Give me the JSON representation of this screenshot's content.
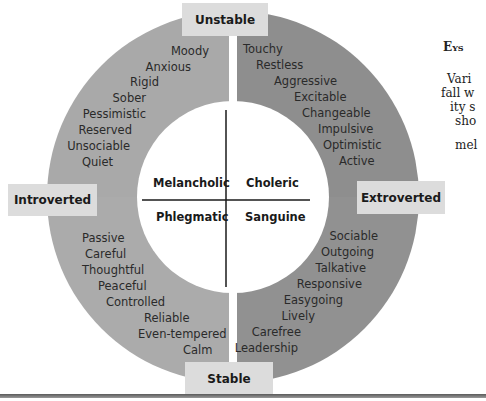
{
  "axes": {
    "top": "Unstable",
    "bottom": "Stable",
    "left": "Introverted",
    "right": "Extroverted"
  },
  "temperaments": {
    "top_left": "Melancholic",
    "top_right": "Choleric",
    "bottom_left": "Phlegmatic",
    "bottom_right": "Sanguine"
  },
  "traits": {
    "melancholic": [
      "Moody",
      "Anxious",
      "Rigid",
      "Sober",
      "Pessimistic",
      "Reserved",
      "Unsociable",
      "Quiet"
    ],
    "choleric": [
      "Touchy",
      "Restless",
      "Aggressive",
      "Excitable",
      "Changeable",
      "Impulsive",
      "Optimistic",
      "Active"
    ],
    "phlegmatic": [
      "Passive",
      "Careful",
      "Thoughtful",
      "Peaceful",
      "Controlled",
      "Reliable",
      "Even-tempered",
      "Calm"
    ],
    "sanguine": [
      "Sociable",
      "Outgoing",
      "Talkative",
      "Responsive",
      "Easygoing",
      "Lively",
      "Carefree",
      "Leadership"
    ]
  },
  "colors": {
    "top_left": "#a9a9a9",
    "top_right": "#8e8e8e",
    "bottom_left": "#ababab",
    "bottom_right": "#919191",
    "label_box": "#dcdcdc"
  },
  "side_text": {
    "heading": "Eys",
    "lines": [
      "Vari",
      "fall w",
      "ity s",
      "sho",
      "mel"
    ]
  }
}
